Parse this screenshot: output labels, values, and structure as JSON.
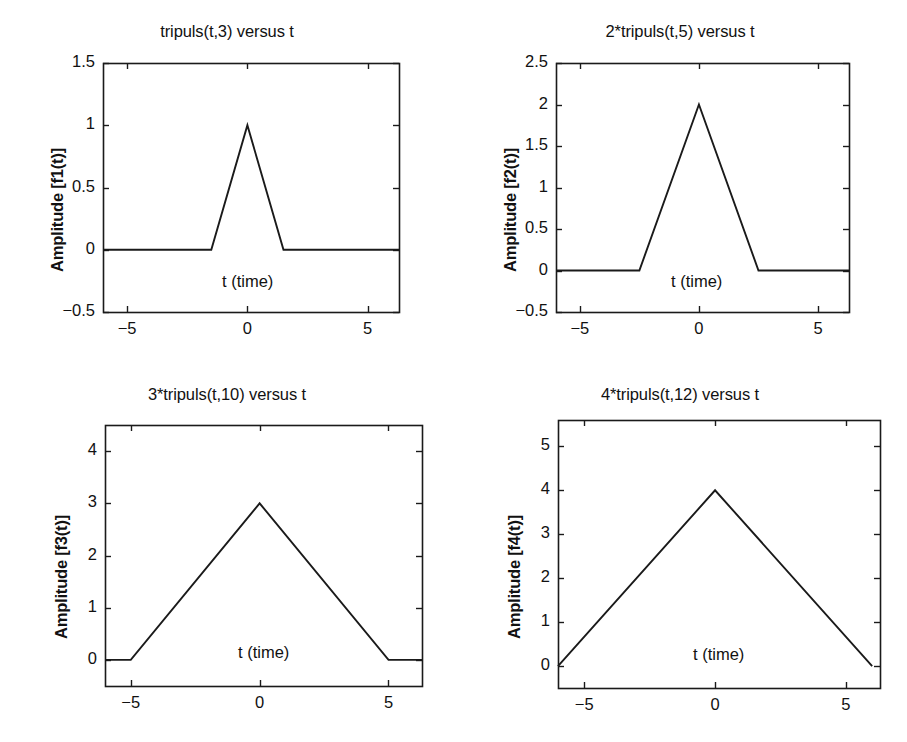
{
  "figure": {
    "width": 907,
    "height": 742,
    "background": "#ffffff",
    "line_color": "#1a1a1a",
    "axis_color": "#1a1a1a",
    "layout": "2x2 subplot grid"
  },
  "chart_data": [
    {
      "id": "f1",
      "type": "line",
      "title": "tripuls(t,3) versus t",
      "xlabel": "t (time)",
      "ylabel": "Amplitude [f1(t)]",
      "xlim": [
        -6,
        6.3
      ],
      "ylim": [
        -0.5,
        1.5
      ],
      "xticks": [
        -5,
        0,
        5
      ],
      "xticklabels": [
        "−5",
        "0",
        "5"
      ],
      "yticks": [
        -0.5,
        0,
        0.5,
        1,
        1.5
      ],
      "yticklabels": [
        "−0.5",
        "0",
        "0.5",
        "1",
        "1.5"
      ],
      "grid": false,
      "legend": null,
      "series": [
        {
          "name": "tripuls(t,3)",
          "x": [
            -6,
            -1.5,
            0,
            1.5,
            6.3
          ],
          "y": [
            0,
            0,
            1,
            0,
            0
          ]
        }
      ]
    },
    {
      "id": "f2",
      "type": "line",
      "title": "2*tripuls(t,5) versus t",
      "xlabel": "t (time)",
      "ylabel": "Amplitude [f2(t)]",
      "xlim": [
        -6,
        6.3
      ],
      "ylim": [
        -0.5,
        2.5
      ],
      "xticks": [
        -5,
        0,
        5
      ],
      "xticklabels": [
        "−5",
        "0",
        "5"
      ],
      "yticks": [
        -0.5,
        0,
        0.5,
        1,
        1.5,
        2,
        2.5
      ],
      "yticklabels": [
        "−0.5",
        "0",
        "0.5",
        "1",
        "1.5",
        "2",
        "2.5"
      ],
      "grid": false,
      "legend": null,
      "series": [
        {
          "name": "2*tripuls(t,5)",
          "x": [
            -6,
            -2.5,
            0,
            2.5,
            6.3
          ],
          "y": [
            0,
            0,
            2,
            0,
            0
          ]
        }
      ]
    },
    {
      "id": "f3",
      "type": "line",
      "title": "3*tripuls(t,10) versus t",
      "xlabel": "t (time)",
      "ylabel": "Amplitude [f3(t)]",
      "xlim": [
        -6,
        6.3
      ],
      "ylim": [
        -0.5,
        4.5
      ],
      "xticks": [
        -5,
        0,
        5
      ],
      "xticklabels": [
        "−5",
        "0",
        "5"
      ],
      "yticks": [
        0,
        1,
        2,
        3,
        4
      ],
      "yticklabels": [
        "0",
        "1",
        "2",
        "3",
        "4"
      ],
      "grid": false,
      "legend": null,
      "series": [
        {
          "name": "3*tripuls(t,10)",
          "x": [
            -6,
            -5,
            0,
            5,
            6.3
          ],
          "y": [
            0,
            0,
            3,
            0,
            0
          ]
        }
      ]
    },
    {
      "id": "f4",
      "type": "line",
      "title": "4*tripuls(t,12) versus t",
      "xlabel": "t (time)",
      "ylabel": "Amplitude [f4(t)]",
      "xlim": [
        -6,
        6.3
      ],
      "ylim": [
        -0.5,
        5.6
      ],
      "xticks": [
        -5,
        0,
        5
      ],
      "xticklabels": [
        "−5",
        "0",
        "5"
      ],
      "yticks": [
        0,
        1,
        2,
        3,
        4,
        5
      ],
      "yticklabels": [
        "0",
        "1",
        "2",
        "3",
        "4",
        "5"
      ],
      "grid": false,
      "legend": null,
      "series": [
        {
          "name": "4*tripuls(t,12)",
          "x": [
            -6,
            0,
            6
          ],
          "y": [
            0,
            4,
            0
          ]
        }
      ]
    }
  ]
}
